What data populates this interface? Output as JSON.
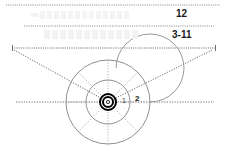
{
  "canvas": {
    "width": 226,
    "height": 159,
    "background": "#ffffff"
  },
  "diagram": {
    "type": "target-sector-diagram",
    "title": "",
    "line_color": "#8a8a8a",
    "dot_color": "#777777",
    "accent_color": "#000000",
    "ghost_color": "#f4f4f4"
  },
  "reference_lines": [
    {
      "name": "top-guide",
      "y": 5,
      "x1": 6,
      "x2": 220,
      "style": "dotted"
    },
    {
      "name": "mid-guide",
      "y": 26,
      "x1": 24,
      "x2": 214,
      "style": "dotted"
    },
    {
      "name": "lower-guide",
      "y": 48,
      "x1": 12,
      "x2": 216,
      "style": "dotted",
      "end_ticks": true
    }
  ],
  "labels": {
    "upper": "12",
    "lower": "3-11"
  },
  "target": {
    "center_x": 108,
    "center_y": 102,
    "rings": [
      {
        "name": "outer-ring",
        "radius": 42,
        "style": "solid"
      },
      {
        "name": "inner-ring",
        "radius": 22,
        "style": "solid"
      },
      {
        "name": "spiral-ring",
        "radius": 34,
        "style": "solid-partial"
      }
    ],
    "bullseye": {
      "outer_radius": 8,
      "mid_radius": 5.5,
      "inner_radius": 3,
      "color": "#000000"
    },
    "spokes": {
      "count": 8,
      "style": "dotted",
      "start_radius": 10,
      "end_radius": 42
    },
    "ring_labels": [
      {
        "name": "ring-label-1",
        "text": "1"
      },
      {
        "name": "ring-label-2",
        "text": "2"
      }
    ]
  },
  "cone": {
    "name": "v-cone",
    "apex_x": 108,
    "apex_y": 102,
    "left_x": 14,
    "right_x": 212,
    "top_y": 50,
    "style": "dotted"
  },
  "axis": {
    "name": "horizontal-axis",
    "y": 102,
    "x1": 16,
    "x2": 214,
    "style": "dotted"
  },
  "ghost_rows": [
    {
      "name": "ghost-row-a",
      "cells": 13
    },
    {
      "name": "ghost-row-b",
      "cells": 12
    }
  ]
}
